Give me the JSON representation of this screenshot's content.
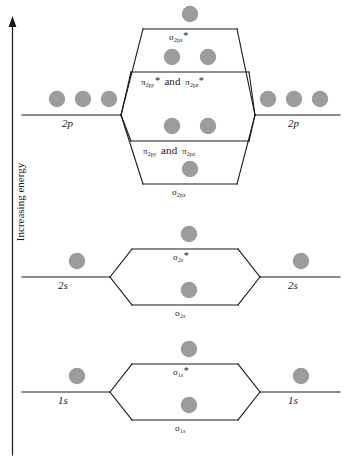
{
  "figure": {
    "kind": "molecular-orbital-energy-diagram",
    "axis": {
      "label": "Increasing energy",
      "direction": "up",
      "arrow": "arrow-up-icon"
    },
    "orbital_fill_color": "#9c9c9c",
    "line_color": "#1a1a1a",
    "background": "#ffffff"
  },
  "blocks": [
    {
      "id": "2p",
      "atomic_left_label": "2p",
      "atomic_right_label": "2p",
      "atomic_left_electrons": 3,
      "atomic_right_electrons": 3,
      "molecular_levels": [
        {
          "id": "sigma-2px-antibonding",
          "label_sigma": "σ",
          "label_sub": "2p",
          "label_sub_it": "x",
          "label_star": "*",
          "electrons": 1
        },
        {
          "id": "pi-2py-2pz-antibonding",
          "label_text": "π",
          "label_sub": "2p",
          "label_sub_it": "y",
          "label_star": "*",
          "conjunction": "and",
          "label2_text": "π",
          "label2_sub": "2p",
          "label2_sub_it": "z",
          "label2_star": "*",
          "electrons": 2
        },
        {
          "id": "pi-2py-2pz-bonding",
          "label_text": "π",
          "label_sub": "2p",
          "label_sub_it": "y",
          "label_star": "",
          "conjunction": "and",
          "label2_text": "π",
          "label2_sub": "2p",
          "label2_sub_it": "z",
          "label2_star": "",
          "electrons": 2
        },
        {
          "id": "sigma-2px-bonding",
          "label_sigma": "σ",
          "label_sub": "2p",
          "label_sub_it": "x",
          "label_star": "",
          "electrons": 1
        }
      ]
    },
    {
      "id": "2s",
      "atomic_left_label": "2s",
      "atomic_right_label": "2s",
      "atomic_left_electrons": 1,
      "atomic_right_electrons": 1,
      "molecular_levels": [
        {
          "id": "sigma-2s-antibonding",
          "label_sigma": "σ",
          "label_sub": "2",
          "label_sub_it": "s",
          "label_star": "*",
          "electrons": 1
        },
        {
          "id": "sigma-2s-bonding",
          "label_sigma": "σ",
          "label_sub": "2",
          "label_sub_it": "s",
          "label_star": "",
          "electrons": 1
        }
      ]
    },
    {
      "id": "1s",
      "atomic_left_label": "1s",
      "atomic_right_label": "1s",
      "atomic_left_electrons": 1,
      "atomic_right_electrons": 1,
      "molecular_levels": [
        {
          "id": "sigma-1s-antibonding",
          "label_sigma": "σ",
          "label_sub": "1",
          "label_sub_it": "s",
          "label_star": "*",
          "electrons": 1
        },
        {
          "id": "sigma-1s-bonding",
          "label_sigma": "σ",
          "label_sub": "1",
          "label_sub_it": "s",
          "label_star": "",
          "electrons": 1
        }
      ]
    }
  ],
  "text": {
    "axis_energy": "Increasing energy",
    "ao_2p_left": "2p",
    "ao_2p_right": "2p",
    "ao_2s_left": "2s",
    "ao_2s_right": "2s",
    "ao_1s_left": "1s",
    "ao_1s_right": "1s",
    "sigma": "σ",
    "pi": "π",
    "star": "*",
    "and": "and",
    "sub_2p": "2p",
    "sub_2": "2",
    "sub_1": "1",
    "sub_x": "x",
    "sub_y": "y",
    "sub_z": "z",
    "sub_s": "s"
  }
}
